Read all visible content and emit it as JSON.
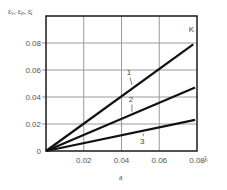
{
  "chart_data": {
    "type": "line",
    "title": "",
    "caption": "a",
    "xlabel": "λ",
    "ylabel": "εᵥ, εₚ, εⱼ",
    "xlim": [
      0,
      0.08
    ],
    "ylim": [
      0,
      0.1
    ],
    "xticks": [
      {
        "value": 0.02,
        "label": "0.02"
      },
      {
        "value": 0.04,
        "label": "0.04"
      },
      {
        "value": 0.06,
        "label": "0.06"
      },
      {
        "value": 0.08,
        "label": "0.08"
      }
    ],
    "yticks": [
      {
        "value": 0,
        "label": "0"
      },
      {
        "value": 0.02,
        "label": "0.02"
      },
      {
        "value": 0.04,
        "label": "0.04"
      },
      {
        "value": 0.06,
        "label": "0.06"
      },
      {
        "value": 0.08,
        "label": "0.08"
      }
    ],
    "grid": true,
    "annotations": [
      {
        "text": "K",
        "x": 0.077,
        "y": 0.088
      }
    ],
    "series": [
      {
        "name": "1",
        "x": [
          0,
          0.078
        ],
        "y": [
          0,
          0.079
        ],
        "label_at": {
          "x": 0.044,
          "y": 0.056
        },
        "leader_to": {
          "x": 0.045,
          "y": 0.049
        }
      },
      {
        "name": "2",
        "x": [
          0,
          0.079
        ],
        "y": [
          0,
          0.047
        ],
        "label_at": {
          "x": 0.045,
          "y": 0.036
        },
        "leader_to": {
          "x": 0.045,
          "y": 0.029
        }
      },
      {
        "name": "3",
        "x": [
          0,
          0.079
        ],
        "y": [
          0,
          0.023
        ],
        "label_at": {
          "x": 0.051,
          "y": 0.005
        },
        "leader_to": {
          "x": 0.051,
          "y": 0.013
        }
      }
    ]
  }
}
